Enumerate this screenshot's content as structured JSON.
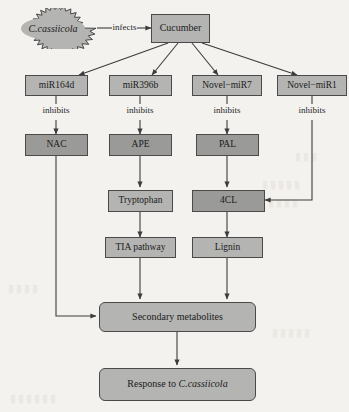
{
  "diagram": {
    "colors": {
      "page_background": "#f3f2ef",
      "node_light_fill": "#b4b4b2",
      "node_dark_fill": "#9a9a98",
      "node_stroke": "#4a4a4a",
      "arrow_stroke": "#3c3c3c",
      "text": "#1b1b1b"
    },
    "pathogen": {
      "name": "C.cassiicola",
      "shape": "starburst-ellipse"
    },
    "edge_labels": {
      "infects": "infects",
      "inhibits_1": "inhibits",
      "inhibits_2": "inhibits",
      "inhibits_3": "inhibits",
      "inhibits_4": "inhibits"
    },
    "nodes": {
      "cucumber": "Cucumber",
      "mir164d": "miR164d",
      "mir396b": "miR396b",
      "novel_mir7": "Novel−miR7",
      "novel_mir1": "Novel−miR1",
      "nac": "NAC",
      "ape": "APE",
      "pal": "PAL",
      "tryptophan": "Tryptophan",
      "fourcl": "4CL",
      "tia_pathway": "TIA pathway",
      "lignin": "Lignin",
      "secondary_metabolites": "Secondary metabolites",
      "response_prefix": "Response to ",
      "response_species": "C.cassiicola"
    },
    "edges": [
      {
        "from": "C.cassiicola",
        "to": "Cucumber",
        "label": "infects"
      },
      {
        "from": "Cucumber",
        "to": "miR164d",
        "label": ""
      },
      {
        "from": "Cucumber",
        "to": "miR396b",
        "label": ""
      },
      {
        "from": "Cucumber",
        "to": "Novel−miR7",
        "label": ""
      },
      {
        "from": "Cucumber",
        "to": "Novel−miR1",
        "label": ""
      },
      {
        "from": "miR164d",
        "to": "NAC",
        "label": "inhibits"
      },
      {
        "from": "miR396b",
        "to": "APE",
        "label": "inhibits"
      },
      {
        "from": "Novel−miR7",
        "to": "PAL",
        "label": "inhibits"
      },
      {
        "from": "Novel−miR1",
        "to": "4CL",
        "label": "inhibits"
      },
      {
        "from": "NAC",
        "to": "Secondary metabolites",
        "label": ""
      },
      {
        "from": "APE",
        "to": "Tryptophan",
        "label": ""
      },
      {
        "from": "PAL",
        "to": "4CL",
        "label": ""
      },
      {
        "from": "Tryptophan",
        "to": "TIA pathway",
        "label": ""
      },
      {
        "from": "4CL",
        "to": "Lignin",
        "label": ""
      },
      {
        "from": "TIA pathway",
        "to": "Secondary metabolites",
        "label": ""
      },
      {
        "from": "Lignin",
        "to": "Secondary metabolites",
        "label": ""
      },
      {
        "from": "Secondary metabolites",
        "to": "Response to C.cassiicola",
        "label": ""
      }
    ]
  }
}
